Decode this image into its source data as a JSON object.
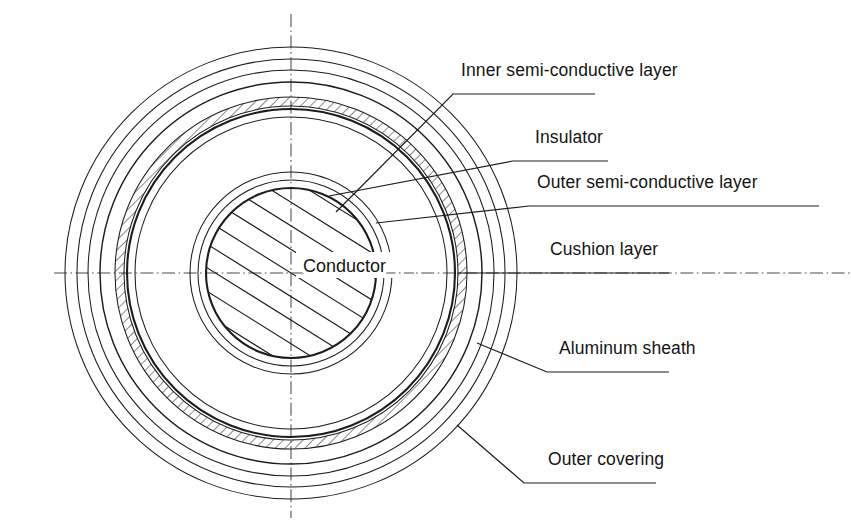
{
  "figure": {
    "kind": "cable-cross-section-diagram",
    "background_color": "#ffffff",
    "line_color": "#1d1d1d",
    "centerline_color": "#4a4a4a",
    "hatch_color": "#2a2a2a",
    "center": {
      "x": 291,
      "y": 273
    }
  },
  "labels": {
    "inner_semi_conductive_layer": "Inner semi-conductive layer",
    "insulator": "Insulator",
    "outer_semi_conductive_layer": "Outer semi-conductive layer",
    "cushion_layer": "Cushion layer",
    "aluminum_sheath": "Aluminum sheath",
    "outer_covering": "Outer covering",
    "conductor": "Conductor"
  },
  "layers": [
    {
      "id": "conductor",
      "label": "Conductor",
      "radius": 86,
      "style": "hatched-solid"
    },
    {
      "id": "inner-semi-conductive-layer",
      "label": "Inner semi-conductive layer",
      "radius": 94,
      "style": "thin-ring"
    },
    {
      "id": "insulator",
      "label": "Insulator",
      "radius": 101,
      "style": "thin-ring"
    },
    {
      "id": "outer-semi-conductive-layer",
      "label": "Outer semi-conductive layer",
      "radius": 158,
      "style": "bold-ring"
    },
    {
      "id": "cushion-layer",
      "label": "Cushion layer",
      "radius": 166,
      "style": "thin-ring"
    },
    {
      "id": "aluminum-sheath",
      "label": "Aluminum sheath",
      "radius_inner": 167,
      "radius_outer": 176,
      "style": "hatched-annulus"
    },
    {
      "id": "outer-covering-1",
      "label": "Outer covering",
      "radius": 191,
      "style": "bold-ring"
    },
    {
      "id": "outer-covering-2",
      "label": "Outer covering",
      "radius": 203,
      "style": "thin-ring"
    },
    {
      "id": "outer-covering-3",
      "label": "Outer covering",
      "radius": 214,
      "style": "thin-ring"
    },
    {
      "id": "outer-covering-4",
      "label": "Outer covering",
      "radius": 226,
      "style": "thin-ring"
    }
  ],
  "centerlines": {
    "vertical": {
      "x": 291,
      "y1": 14,
      "y2": 518
    },
    "horizontal": {
      "y": 273,
      "x1": 54,
      "x2": 851
    }
  },
  "callouts": [
    {
      "id": "inner-semi-conductive-layer",
      "label": "Inner semi-conductive layer",
      "text_x": 461,
      "text_y": 76,
      "underline_x1": 453,
      "underline_x2": 595,
      "underline_y": 94,
      "anchor_x": 336,
      "anchor_y": 212
    },
    {
      "id": "insulator",
      "label": "Insulator",
      "text_x": 535,
      "text_y": 143,
      "underline_x1": 513,
      "underline_x2": 608,
      "underline_y": 161,
      "anchor_x": 329,
      "anchor_y": 196
    },
    {
      "id": "outer-semi-conductive-layer",
      "label": "Outer semi-conductive layer",
      "text_x": 537,
      "text_y": 188,
      "underline_x1": 529,
      "underline_x2": 819,
      "underline_y": 206,
      "anchor_x": 376,
      "anchor_y": 223
    },
    {
      "id": "cushion-layer",
      "label": "Cushion layer",
      "text_x": 550,
      "text_y": 255,
      "underline_x1": 530,
      "underline_x2": 669,
      "underline_y": 273,
      "anchor_x": 457,
      "anchor_y": 273
    },
    {
      "id": "aluminum-sheath",
      "label": "Aluminum sheath",
      "text_x": 559,
      "text_y": 354,
      "underline_x1": 547,
      "underline_x2": 669,
      "underline_y": 372,
      "anchor_x": 477,
      "anchor_y": 343
    },
    {
      "id": "outer-covering",
      "label": "Outer covering",
      "text_x": 548,
      "text_y": 465,
      "underline_x1": 524,
      "underline_x2": 656,
      "underline_y": 483,
      "anchor_x": 457,
      "anchor_y": 425
    }
  ],
  "inline_labels": [
    {
      "id": "conductor",
      "label": "Conductor",
      "x": 303,
      "y": 269
    }
  ]
}
